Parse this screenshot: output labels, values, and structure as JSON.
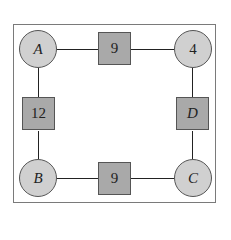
{
  "diagram": {
    "nodes": [
      {
        "id": "A",
        "shape": "circle",
        "label": "A",
        "italic": true
      },
      {
        "id": "top",
        "shape": "square",
        "label": "9",
        "italic": false
      },
      {
        "id": "TR",
        "shape": "circle",
        "label": "4",
        "italic": false
      },
      {
        "id": "left",
        "shape": "square",
        "label": "12",
        "italic": false
      },
      {
        "id": "D",
        "shape": "square",
        "label": "D",
        "italic": true
      },
      {
        "id": "B",
        "shape": "circle",
        "label": "B",
        "italic": true
      },
      {
        "id": "bottom",
        "shape": "square",
        "label": "9",
        "italic": false
      },
      {
        "id": "C",
        "shape": "circle",
        "label": "C",
        "italic": true
      }
    ],
    "edges": [
      [
        "A",
        "top"
      ],
      [
        "top",
        "TR"
      ],
      [
        "TR",
        "D"
      ],
      [
        "D",
        "C"
      ],
      [
        "C",
        "bottom"
      ],
      [
        "bottom",
        "B"
      ],
      [
        "B",
        "left"
      ],
      [
        "left",
        "A"
      ]
    ],
    "colors": {
      "circle_fill": "#d0d0d0",
      "square_fill": "#a9a9a9",
      "line": "#222222"
    }
  }
}
